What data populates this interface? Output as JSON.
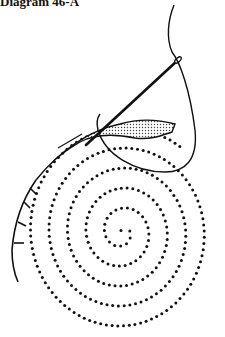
{
  "caption": "Diagram 46-A",
  "colors": {
    "ink": "#111111",
    "background": "#ffffff",
    "stipple": "#555555"
  },
  "spiral": {
    "center": [
      122,
      232
    ],
    "start_angle_deg": 200,
    "turns": 5.3,
    "growth_x": 18.5,
    "growth_y": 20,
    "dot_spacing": 6.2,
    "dot_radius": 1.5
  },
  "elements": {
    "needle": "needle",
    "thread": "thread",
    "stitch_band": "stippled-stitch-band",
    "couching_line": "couched-thread-line"
  }
}
